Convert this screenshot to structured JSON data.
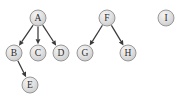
{
  "diagram": {
    "background_color": "#ffffff",
    "node_fill_color": "#d9d9d9",
    "node_highlight_color": "#f2f2f2",
    "node_stroke_color": "#8f8f8f",
    "edge_color": "#3a3a3a",
    "label_color": "#2b2b2b",
    "node_radius": 8,
    "nodes": [
      {
        "id": "A",
        "label": "A",
        "x": 38,
        "y": 18
      },
      {
        "id": "B",
        "label": "B",
        "x": 14,
        "y": 53
      },
      {
        "id": "C",
        "label": "C",
        "x": 38,
        "y": 53
      },
      {
        "id": "D",
        "label": "D",
        "x": 61,
        "y": 53
      },
      {
        "id": "E",
        "label": "E",
        "x": 30,
        "y": 85
      },
      {
        "id": "F",
        "label": "F",
        "x": 107,
        "y": 18
      },
      {
        "id": "G",
        "label": "G",
        "x": 85,
        "y": 53
      },
      {
        "id": "H",
        "label": "H",
        "x": 128,
        "y": 53
      },
      {
        "id": "I",
        "label": "I",
        "x": 166,
        "y": 18
      }
    ],
    "edges": [
      {
        "from": "A",
        "to": "B",
        "directed": true
      },
      {
        "from": "A",
        "to": "C",
        "directed": true
      },
      {
        "from": "A",
        "to": "D",
        "directed": true
      },
      {
        "from": "B",
        "to": "E",
        "directed": true
      },
      {
        "from": "F",
        "to": "G",
        "directed": true
      },
      {
        "from": "F",
        "to": "H",
        "directed": true
      }
    ],
    "isolated_nodes": [
      "I"
    ]
  }
}
